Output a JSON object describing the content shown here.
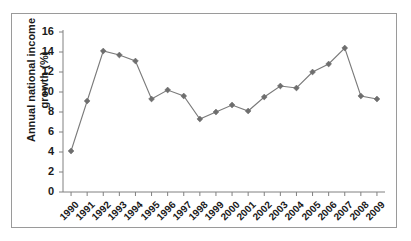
{
  "chart_data": {
    "type": "line",
    "title": "",
    "subtitle": "",
    "xlabel": "",
    "ylabel": "Annual national income growth (%)",
    "ylabel_lines": [
      "Annual national income",
      "growth (%)"
    ],
    "categories": [
      "1990",
      "1991",
      "1992",
      "1993",
      "1994",
      "1995",
      "1996",
      "1997",
      "1998",
      "1999",
      "2000",
      "2001",
      "2002",
      "2003",
      "2004",
      "2005",
      "2006",
      "2007",
      "2008",
      "2009"
    ],
    "values": [
      4.1,
      9.1,
      14.1,
      13.7,
      13.1,
      9.3,
      10.2,
      9.6,
      7.3,
      8.0,
      8.7,
      8.1,
      9.5,
      10.6,
      10.4,
      12.0,
      12.8,
      14.4,
      9.6,
      9.3
    ],
    "ylim": [
      0,
      16
    ],
    "ytick_step": 2,
    "yticks": [
      "0",
      "2",
      "4",
      "6",
      "8",
      "10",
      "12",
      "14",
      "16"
    ],
    "grid": false,
    "legend": false,
    "legend_position": "none",
    "marker": "diamond",
    "series_color": "#6e6e6e",
    "line_color": "#7a7a7a",
    "axis_color": "#808080",
    "text_color": "#1a1a1a",
    "border_color": "#9a9a9a",
    "background": "#ffffff"
  }
}
